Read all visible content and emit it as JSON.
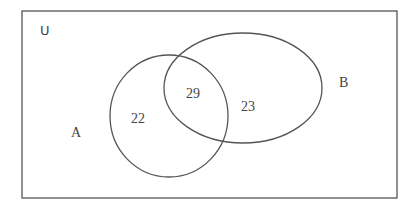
{
  "diagram": {
    "type": "venn",
    "universe_label": "U",
    "sets": [
      {
        "name": "A",
        "label": "A",
        "only_count": "22"
      },
      {
        "name": "B",
        "label": "B",
        "only_count": "23"
      }
    ],
    "intersection": {
      "sets": [
        "A",
        "B"
      ],
      "count": "29"
    },
    "stroke_color": "#555555",
    "background": "#ffffff"
  }
}
